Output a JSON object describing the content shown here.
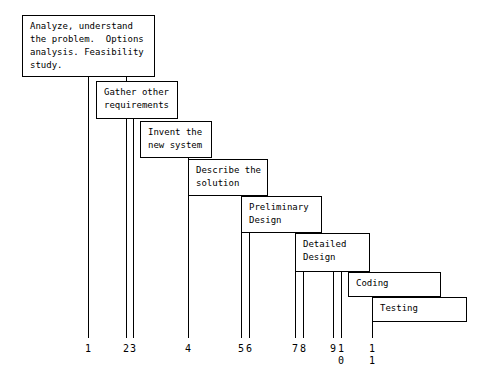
{
  "diagram": {
    "background_color": "#ffffff",
    "line_color": "#000000",
    "stages": [
      {
        "id": "analysis",
        "label": "Analyze, understand\nthe problem.  Options\nanalysis. Feasibility\nstudy.",
        "x": 22,
        "y": 15,
        "width": 133,
        "height": 62
      },
      {
        "id": "requirements",
        "label": "Gather other\nrequirements",
        "x": 96,
        "y": 81,
        "width": 82,
        "height": 38
      },
      {
        "id": "invention",
        "label": "Invent the\nnew system",
        "x": 140,
        "y": 121,
        "width": 72,
        "height": 37
      },
      {
        "id": "description",
        "label": "Describe the\nsolution",
        "x": 188,
        "y": 159,
        "width": 80,
        "height": 37
      },
      {
        "id": "preliminary-design",
        "label": "Preliminary\nDesign",
        "x": 241,
        "y": 196,
        "width": 81,
        "height": 37
      },
      {
        "id": "detailed-design",
        "label": "Detailed\nDesign",
        "x": 295,
        "y": 233,
        "width": 75,
        "height": 39
      },
      {
        "id": "coding",
        "label": "Coding",
        "x": 348,
        "y": 272,
        "width": 93,
        "height": 25
      },
      {
        "id": "testing",
        "label": "Testing",
        "x": 372,
        "y": 297,
        "width": 95,
        "height": 25
      }
    ],
    "drop_lines": [
      {
        "id": "line-1",
        "x": 88,
        "y_top": 77,
        "y_bottom": 338
      },
      {
        "id": "line-2",
        "x": 126,
        "y_top": 77,
        "y_bottom": 338
      },
      {
        "id": "line-3",
        "x": 133,
        "y_top": 119,
        "y_bottom": 338
      },
      {
        "id": "line-4",
        "x": 188,
        "y_top": 158,
        "y_bottom": 338
      },
      {
        "id": "line-5",
        "x": 241,
        "y_top": 196,
        "y_bottom": 338
      },
      {
        "id": "line-6",
        "x": 249,
        "y_top": 196,
        "y_bottom": 338
      },
      {
        "id": "line-7",
        "x": 295,
        "y_top": 233,
        "y_bottom": 338
      },
      {
        "id": "line-8",
        "x": 303,
        "y_top": 233,
        "y_bottom": 338
      },
      {
        "id": "line-9",
        "x": 333,
        "y_top": 272,
        "y_bottom": 338
      },
      {
        "id": "line-10",
        "x": 341,
        "y_top": 272,
        "y_bottom": 338
      },
      {
        "id": "line-11",
        "x": 372,
        "y_top": 297,
        "y_bottom": 338
      }
    ],
    "tick_labels": [
      {
        "id": "tick-1",
        "text": "1",
        "x": 88,
        "y": 343
      },
      {
        "id": "tick-2",
        "text": "2",
        "x": 126,
        "y": 343
      },
      {
        "id": "tick-3",
        "text": "3",
        "x": 133,
        "y": 343
      },
      {
        "id": "tick-4",
        "text": "4",
        "x": 188,
        "y": 343
      },
      {
        "id": "tick-5",
        "text": "5",
        "x": 241,
        "y": 343
      },
      {
        "id": "tick-6",
        "text": "6",
        "x": 249,
        "y": 343
      },
      {
        "id": "tick-7",
        "text": "7",
        "x": 295,
        "y": 343
      },
      {
        "id": "tick-8",
        "text": "8",
        "x": 303,
        "y": 343
      },
      {
        "id": "tick-9",
        "text": "9",
        "x": 333,
        "y": 343
      },
      {
        "id": "tick-10",
        "text": "1\n0",
        "x": 341,
        "y": 343
      },
      {
        "id": "tick-11",
        "text": "1\n1",
        "x": 372,
        "y": 343
      }
    ]
  }
}
